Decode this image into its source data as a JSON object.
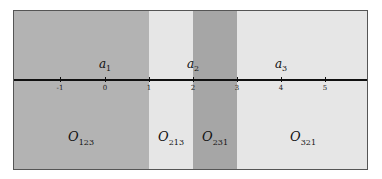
{
  "diagram": {
    "axis": {
      "ticks": [
        {
          "value": "-1",
          "x": 46
        },
        {
          "value": "0",
          "x": 91
        },
        {
          "value": "1",
          "x": 135
        },
        {
          "value": "2",
          "x": 179
        },
        {
          "value": "3",
          "x": 223
        },
        {
          "value": "4",
          "x": 267
        },
        {
          "value": "5",
          "x": 311
        }
      ]
    },
    "points": [
      {
        "base": "a",
        "sub": "1",
        "x": 91
      },
      {
        "base": "a",
        "sub": "2",
        "x": 179
      },
      {
        "base": "a",
        "sub": "3",
        "x": 267
      }
    ],
    "regions": [
      {
        "base": "O",
        "sub": "123",
        "left": 0,
        "width": 135,
        "color": "#b3b3b3",
        "label_x": 67
      },
      {
        "base": "O",
        "sub": "213",
        "left": 135,
        "width": 44,
        "color": "#e6e6e6",
        "label_x": 157
      },
      {
        "base": "O",
        "sub": "231",
        "left": 179,
        "width": 44,
        "color": "#a6a6a6",
        "label_x": 201
      },
      {
        "base": "O",
        "sub": "321",
        "left": 223,
        "width": 132,
        "color": "#e6e6e6",
        "label_x": 289
      }
    ]
  }
}
